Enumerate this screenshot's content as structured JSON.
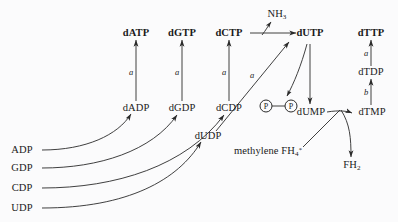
{
  "diagram": {
    "background_color": "#fbfbfc",
    "stroke_color": "#2a2a2a",
    "text_color": "#1a1a1a",
    "nodes": {
      "datp": "dATP",
      "dgtp": "dGTP",
      "dctp": "dCTP",
      "dutp": "dUTP",
      "dttp": "dTTP",
      "dadp": "dADP",
      "dgdp": "dGDP",
      "dcdp": "dCDP",
      "dudp": "dUDP",
      "dtdp": "dTDP",
      "dump": "dUMP",
      "dtmp": "dTMP",
      "adp": "ADP",
      "gdp": "GDP",
      "cdp": "CDP",
      "udp": "UDP",
      "nh3": "NH",
      "nh3_sub": "3",
      "fh2": "FH",
      "fh2_sub": "2",
      "methylene": "methylene FH",
      "methylene_sub": "4",
      "methylene_sup": "*",
      "phosphate_1": "P",
      "phosphate_2": "P"
    },
    "edge_labels": {
      "a_datp": "a",
      "a_dgtp": "a",
      "a_dctp": "a",
      "a_dutp": "a",
      "a_dttp": "a",
      "b_dtdp": "b"
    }
  }
}
